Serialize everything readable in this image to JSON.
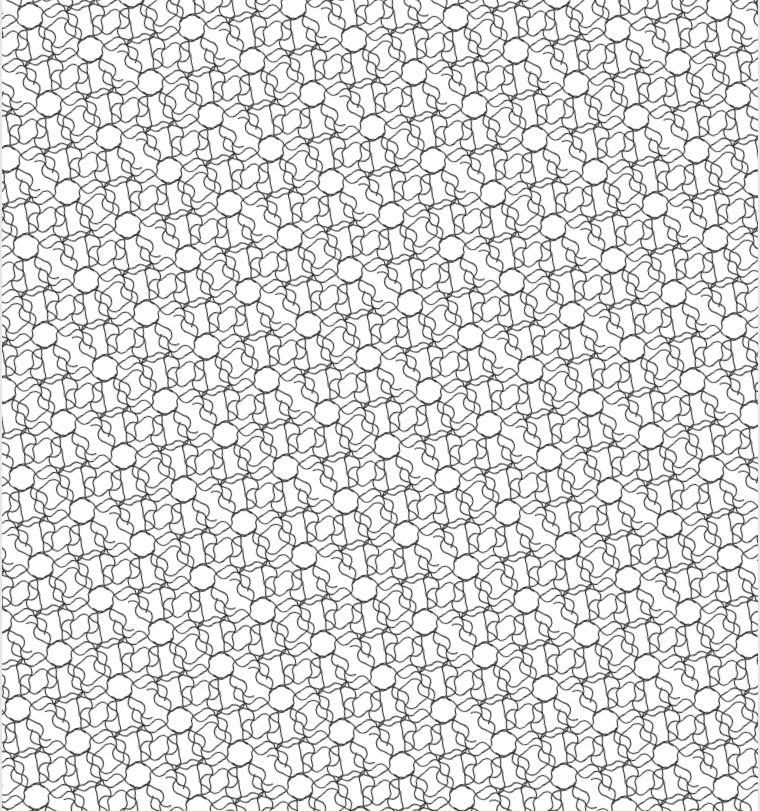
{
  "image": {
    "description": "Monochrome line-art tessellation of curvy, interlocking spiral tiles arranged in rotational clusters",
    "width": 760,
    "height": 811,
    "background_color": "#ffffff",
    "stroke_color": "#2a2a2a",
    "stroke_width": 1.1
  }
}
